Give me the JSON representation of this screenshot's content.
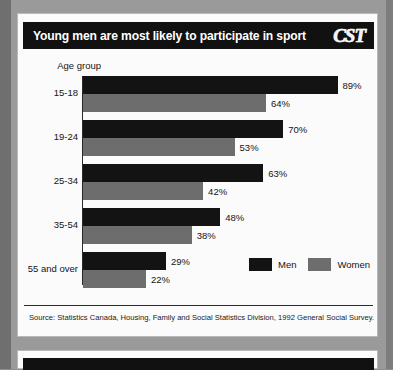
{
  "panel": {
    "title": "Young men are most likely to participate in sport",
    "logo": "CST",
    "logo_icon": "cst-logo-icon",
    "source": "Source: Statistics Canada, Housing, Family and Social Statistics Division, 1992 General Social Survey."
  },
  "chart_data": {
    "type": "bar",
    "orientation": "horizontal",
    "title": "Young men are most likely to participate in sport",
    "xlabel": "",
    "ylabel": "Age group",
    "axis_label": "Age group",
    "categories": [
      "15-18",
      "19-24",
      "25-34",
      "35-54",
      "55 and over"
    ],
    "series": [
      {
        "name": "Men",
        "color": "#131313",
        "values": [
          89,
          70,
          63,
          48,
          29
        ],
        "labels": [
          "89%",
          "70%",
          "63%",
          "48%",
          "29%"
        ]
      },
      {
        "name": "Women",
        "color": "#6d6d6d",
        "values": [
          64,
          53,
          42,
          38,
          22
        ],
        "labels": [
          "64%",
          "53%",
          "42%",
          "38%",
          "22%"
        ]
      }
    ],
    "value_unit": "%",
    "xlim": [
      0,
      100
    ],
    "grid": false,
    "legend_position": "bottom-right",
    "legend": [
      "Men",
      "Women"
    ]
  }
}
